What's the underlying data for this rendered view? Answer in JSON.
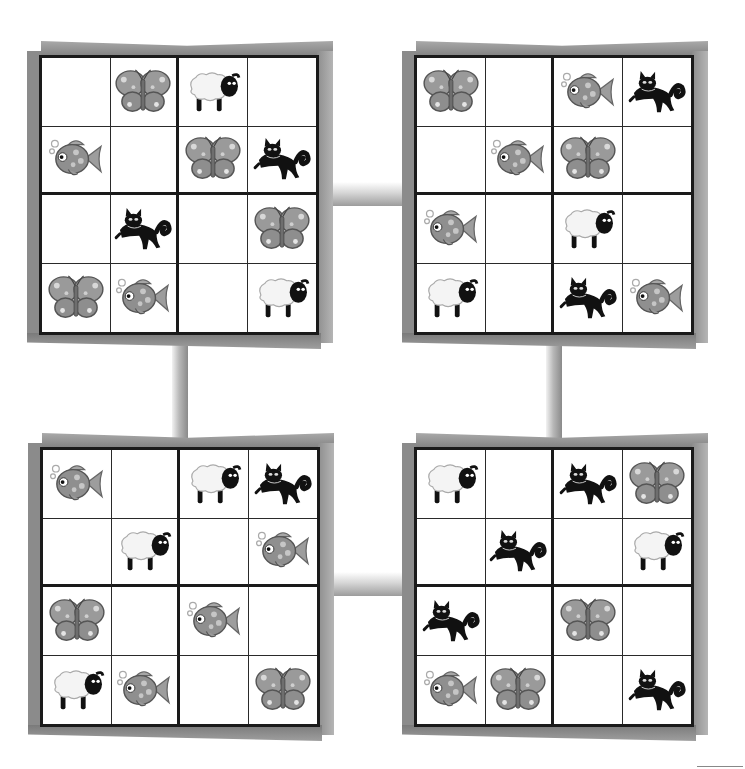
{
  "page": {
    "colors": {
      "grid_line": "#1a1a1a",
      "frame_shadow": "#8b8b8b",
      "background": "#ffffff"
    }
  },
  "icons": {
    "butterfly": "butterfly-icon",
    "sheep": "sheep-icon",
    "fish": "fish-icon",
    "cat": "cat-icon"
  },
  "puzzles": [
    {
      "id": "top-left",
      "rows": [
        [
          "",
          "butterfly",
          "sheep",
          ""
        ],
        [
          "fish",
          "",
          "butterfly",
          "cat"
        ],
        [
          "",
          "cat",
          "",
          "butterfly"
        ],
        [
          "butterfly",
          "fish",
          "",
          "sheep"
        ]
      ]
    },
    {
      "id": "top-right",
      "rows": [
        [
          "butterfly",
          "",
          "fish",
          "cat"
        ],
        [
          "",
          "fish",
          "butterfly",
          ""
        ],
        [
          "fish",
          "",
          "sheep",
          ""
        ],
        [
          "sheep",
          "",
          "cat",
          "fish"
        ]
      ]
    },
    {
      "id": "bottom-left",
      "rows": [
        [
          "fish",
          "",
          "sheep",
          "cat"
        ],
        [
          "",
          "sheep",
          "",
          "fish"
        ],
        [
          "butterfly",
          "",
          "fish",
          ""
        ],
        [
          "sheep",
          "fish",
          "",
          "butterfly"
        ]
      ]
    },
    {
      "id": "bottom-right",
      "rows": [
        [
          "sheep",
          "",
          "cat",
          "butterfly"
        ],
        [
          "",
          "cat",
          "",
          "sheep"
        ],
        [
          "cat",
          "",
          "butterfly",
          ""
        ],
        [
          "fish",
          "butterfly",
          "",
          "cat"
        ]
      ]
    }
  ]
}
